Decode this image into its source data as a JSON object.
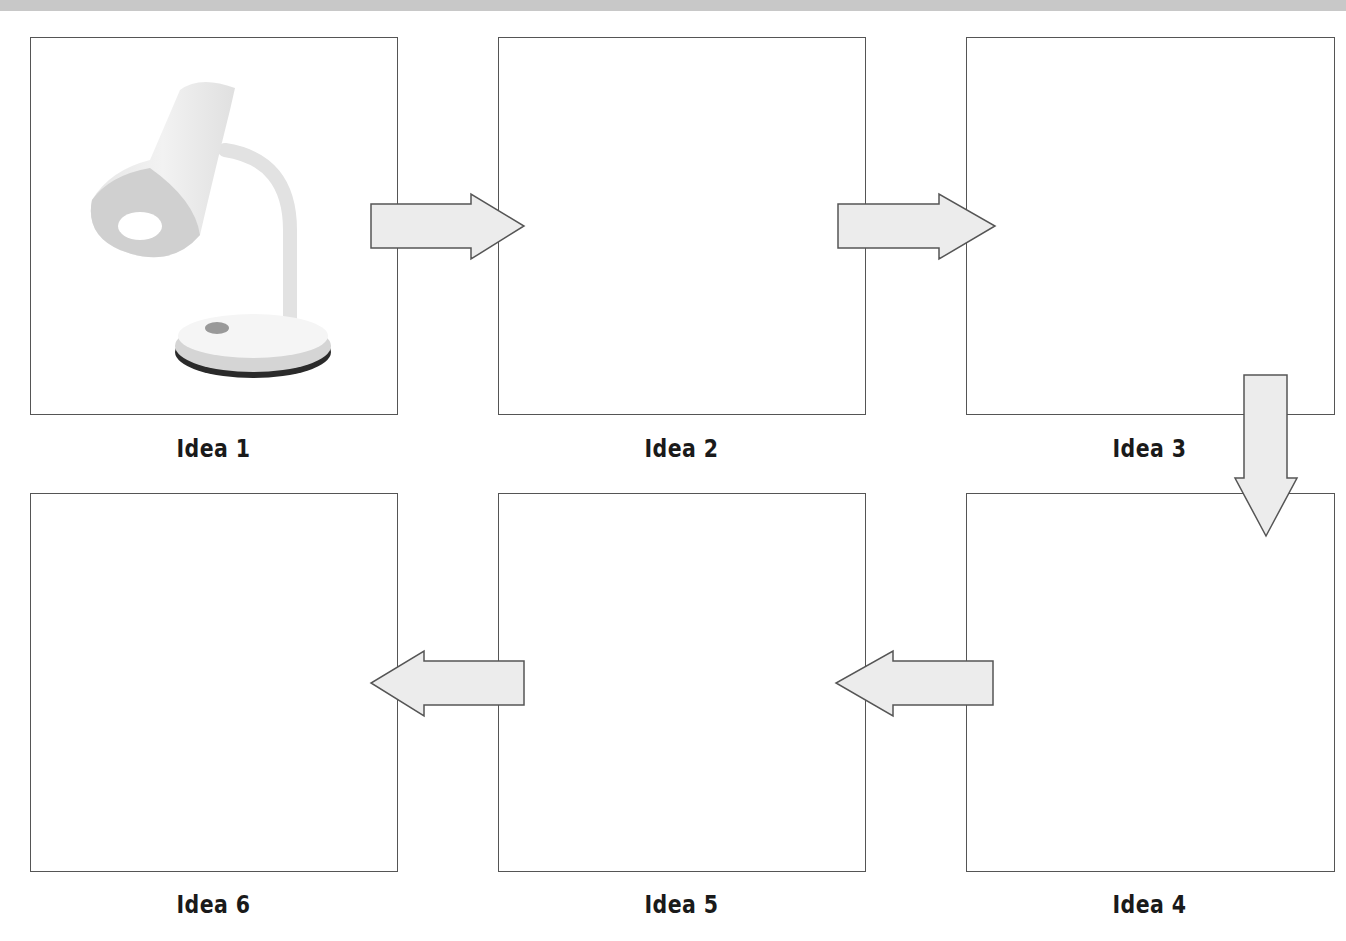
{
  "diagram": {
    "type": "flow-grid",
    "colors": {
      "box_border": "#555555",
      "arrow_fill": "#ececec",
      "arrow_stroke": "#555555",
      "top_bar": "#c8c8c8",
      "label": "#1a1a1a"
    },
    "boxes": [
      {
        "id": 1,
        "label": "Idea 1",
        "image": "desk-lamp"
      },
      {
        "id": 2,
        "label": "Idea 2"
      },
      {
        "id": 3,
        "label": "Idea 3"
      },
      {
        "id": 4,
        "label": "Idea 4"
      },
      {
        "id": 5,
        "label": "Idea 5"
      },
      {
        "id": 6,
        "label": "Idea 6"
      }
    ],
    "arrows": [
      {
        "from": 1,
        "to": 2,
        "direction": "right"
      },
      {
        "from": 2,
        "to": 3,
        "direction": "right"
      },
      {
        "from": 3,
        "to": 4,
        "direction": "down"
      },
      {
        "from": 4,
        "to": 5,
        "direction": "left"
      },
      {
        "from": 5,
        "to": 6,
        "direction": "left"
      }
    ]
  }
}
